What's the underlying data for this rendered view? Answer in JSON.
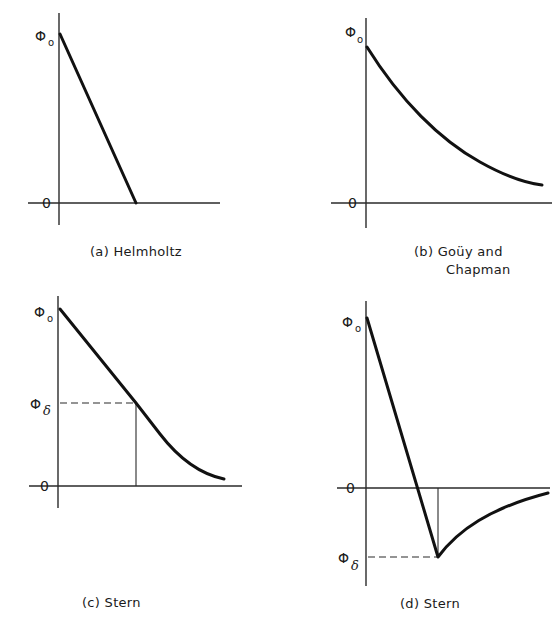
{
  "panels": [
    {
      "id": "a",
      "caption": "(a) Helmholtz",
      "y_top_label": "Φ",
      "y_top_sub": "o",
      "zero_label": "0",
      "model": "Helmholtz",
      "shape": "linear drop from Φo to 0"
    },
    {
      "id": "b",
      "caption_line1": "(b)  Goüy and",
      "caption_line2": "Chapman",
      "y_top_label": "Φ",
      "y_top_sub": "o",
      "zero_label": "0",
      "model": "Goüy and Chapman",
      "shape": "exponential decay from Φo toward 0"
    },
    {
      "id": "c",
      "caption": "(c) Stern",
      "y_top_label": "Φ",
      "y_top_sub": "o",
      "y_mid_label": "Φ",
      "y_mid_sub": "δ",
      "zero_label": "0",
      "model": "Stern",
      "shape": "linear drop from Φo to Φδ then diffuse decay toward 0"
    },
    {
      "id": "d",
      "caption": "(d) Stern",
      "y_top_label": "Φ",
      "y_top_sub": "o",
      "y_low_label": "Φ",
      "y_low_sub": "δ",
      "zero_label": "0",
      "model": "Stern",
      "shape": "linear drop from Φo past 0 to negative Φδ, then decay back toward 0"
    }
  ],
  "colors": {
    "background": "#ffffff",
    "ink": "#111111"
  }
}
